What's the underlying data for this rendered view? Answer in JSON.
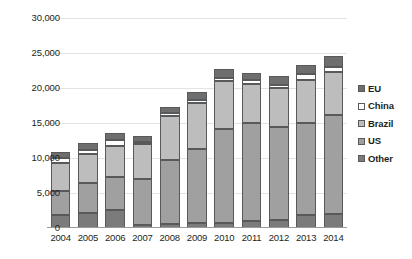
{
  "chart_data": {
    "type": "bar",
    "subtype": "stacked-bar",
    "title": "",
    "xlabel": "",
    "ylabel": "",
    "grid": true,
    "legend_position": "right",
    "ylim": [
      0,
      30000
    ],
    "yticks": [
      0,
      5000,
      10000,
      15000,
      20000,
      25000,
      30000
    ],
    "ytick_labels": [
      "0",
      "5,000",
      "10,000",
      "15,000",
      "20,000",
      "25,000",
      "30,000"
    ],
    "categories": [
      "2004",
      "2005",
      "2006",
      "2007",
      "2008",
      "2009",
      "2010",
      "2011",
      "2012",
      "2013",
      "2014"
    ],
    "series": [
      {
        "name": "Other",
        "color": "#7b7b7b",
        "values": [
          1800,
          2100,
          2550,
          450,
          550,
          700,
          700,
          1050,
          1150,
          1800,
          2000
        ]
      },
      {
        "name": "US",
        "color": "#a0a0a0",
        "values": [
          3500,
          4300,
          4700,
          6600,
          9150,
          10600,
          13400,
          14000,
          13350,
          13250,
          14200
        ]
      },
      {
        "name": "Brazil",
        "color": "#bdbdbd",
        "values": [
          4000,
          4150,
          4450,
          4900,
          6350,
          6600,
          6850,
          5550,
          5500,
          6100,
          6100
        ]
      },
      {
        "name": "China",
        "color": "#ffffff",
        "values": [
          650,
          650,
          900,
          300,
          350,
          400,
          450,
          550,
          500,
          800,
          700
        ]
      },
      {
        "name": "EU",
        "color": "#6e6e6e",
        "values": [
          850,
          900,
          1000,
          900,
          900,
          1200,
          1350,
          1050,
          1200,
          1400,
          1550
        ]
      }
    ],
    "totals": [
      10800,
      12100,
      13600,
      13150,
      17300,
      19500,
      22750,
      22200,
      21700,
      23350,
      24550
    ],
    "legend_entries": [
      {
        "label": "EU",
        "color": "#6e6e6e"
      },
      {
        "label": "China",
        "color": "#ffffff"
      },
      {
        "label": "Brazil",
        "color": "#bdbdbd"
      },
      {
        "label": "US",
        "color": "#a0a0a0"
      },
      {
        "label": "Other",
        "color": "#7b7b7b"
      }
    ]
  }
}
